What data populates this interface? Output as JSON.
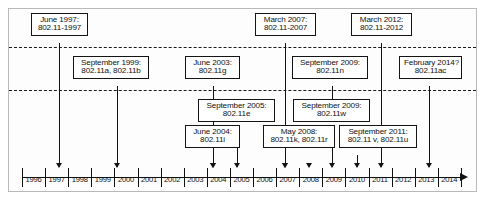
{
  "figure": {
    "accent_color": "#111111",
    "frame_color": "#b9b9b9",
    "background": "#ffffff"
  },
  "axis": {
    "label": "Year",
    "start_year": 1996,
    "end_year": 2014,
    "years": [
      "1996",
      "1997",
      "1998",
      "1999",
      "2000",
      "2001",
      "2002",
      "2003",
      "2004",
      "2005",
      "2006",
      "2007",
      "2008",
      "2009",
      "2010",
      "2011",
      "2012",
      "2013",
      "2014"
    ],
    "marked_years": [
      1997,
      1999,
      2003,
      2004,
      2005,
      2007,
      2008,
      2009,
      2011,
      2012,
      2014
    ],
    "arrow_direction": "right"
  },
  "guide_lines": [
    {
      "name": "upper-dashed-line",
      "y": 47
    },
    {
      "name": "lower-dashed-line",
      "y": 90
    }
  ],
  "events": [
    {
      "id": "june-1997",
      "date": "June 1997:",
      "standards": "802.11-1997",
      "year": 1997,
      "tier": "top"
    },
    {
      "id": "september-1999",
      "date": "September 1999:",
      "standards": "802.11a, 802.11b",
      "year": 1999,
      "tier": "upper-middle"
    },
    {
      "id": "june-2003",
      "date": "June 2003:",
      "standards": "802.11g",
      "year": 2003,
      "tier": "upper-middle"
    },
    {
      "id": "march-2007",
      "date": "March 2007:",
      "standards": "802.11-2007",
      "year": 2007,
      "tier": "top"
    },
    {
      "id": "september-2009-n",
      "date": "September 2009:",
      "standards": "802.11n",
      "year": 2009,
      "tier": "upper-middle"
    },
    {
      "id": "march-2012",
      "date": "March 2012:",
      "standards": "802.11-2012",
      "year": 2012,
      "tier": "top"
    },
    {
      "id": "february-2014",
      "date": "February 2014?",
      "standards": "802.11ac",
      "year": 2014,
      "tier": "upper-middle"
    },
    {
      "id": "september-2005",
      "date": "September 2005:",
      "standards": "802.11e",
      "year": 2005,
      "tier": "lower-middle"
    },
    {
      "id": "september-2009-w",
      "date": "September 2009:",
      "standards": "802.11w",
      "year": 2009,
      "tier": "lower-middle"
    },
    {
      "id": "june-2004",
      "date": "June 2004:",
      "standards": "802.11i",
      "year": 2004,
      "tier": "bottom"
    },
    {
      "id": "may-2008",
      "date": "May 2008:",
      "standards": "802.11k, 802.11r",
      "year": 2008,
      "tier": "bottom"
    },
    {
      "id": "september-2011",
      "date": "September 2011:",
      "standards": "802.11 v, 802.11u",
      "year": 2011,
      "tier": "bottom"
    }
  ]
}
